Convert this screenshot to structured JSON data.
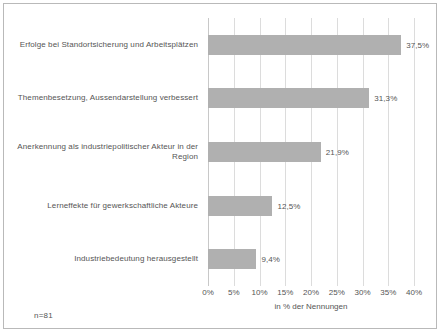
{
  "footnote": "n=81",
  "chart_data": {
    "type": "bar",
    "orientation": "horizontal",
    "title": "",
    "subtitle": "",
    "xlabel": "in % der Nennungen",
    "ylabel": "",
    "xlim": [
      0,
      40
    ],
    "grid": true,
    "legend": "none",
    "bar_color": "#b0b0b0",
    "gridline_color": "#dcdcdc",
    "categories": [
      "Erfolge bei Standortsicherung und Arbeitsplätzen",
      "Themenbesetzung, Aussendarstellung verbessert",
      "Anerkennung als industriepolitischer Akteur in der Region",
      "Lerneffekte für gewerkschaftliche Akteure",
      "Industriebedeutung herausgestellt"
    ],
    "values": [
      37.5,
      31.3,
      21.9,
      12.5,
      9.4
    ],
    "value_labels": [
      "37,5%",
      "31,3%",
      "21,9%",
      "12,5%",
      "9,4%"
    ],
    "xticks": [
      0,
      5,
      10,
      15,
      20,
      25,
      30,
      35,
      40
    ],
    "xtick_labels": [
      "0%",
      "5%",
      "10%",
      "15%",
      "20%",
      "25%",
      "30%",
      "35%",
      "40%"
    ]
  }
}
